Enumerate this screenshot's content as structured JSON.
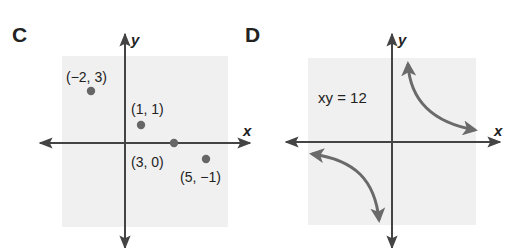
{
  "panels": [
    {
      "label": "C",
      "x_axis_label": "x",
      "y_axis_label": "y",
      "points": [
        {
          "label": "(−2, 3)",
          "x": -2,
          "y": 3
        },
        {
          "label": "(1, 1)",
          "x": 1,
          "y": 1
        },
        {
          "label": "(3, 0)",
          "x": 3,
          "y": 0
        },
        {
          "label": "(5, −1)",
          "x": 5,
          "y": -1
        }
      ]
    },
    {
      "label": "D",
      "x_axis_label": "x",
      "y_axis_label": "y",
      "equation": "xy = 12"
    }
  ],
  "colors": {
    "axis": "#444444",
    "shade": "#f0f0f0",
    "point": "#666666",
    "curve": "#6a6a6a",
    "text": "#222222"
  }
}
